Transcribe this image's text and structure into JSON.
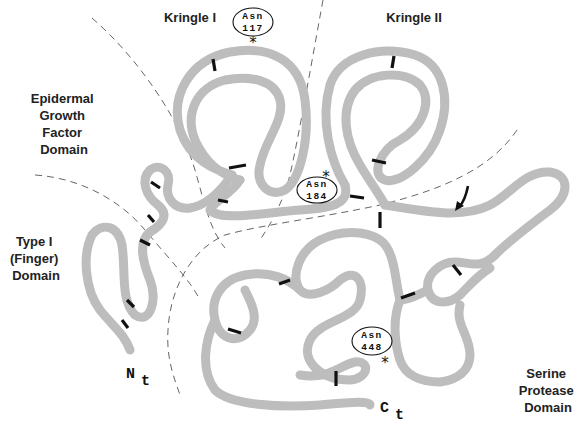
{
  "domains": [
    {
      "id": "kringle1",
      "lines": [
        "Kringle I"
      ]
    },
    {
      "id": "kringle2",
      "lines": [
        "Kringle II"
      ]
    },
    {
      "id": "egf",
      "lines": [
        "Epidermal",
        "Growth",
        "Factor",
        "Domain"
      ]
    },
    {
      "id": "finger",
      "lines": [
        "Type I",
        "(Finger)",
        "Domain"
      ]
    },
    {
      "id": "protease",
      "lines": [
        "Serine",
        "Protease",
        "Domain"
      ]
    }
  ],
  "glycosylation_sites": [
    {
      "residue": "Asn",
      "position": "117",
      "marker": "*"
    },
    {
      "residue": "Asn",
      "position": "184",
      "marker": "*"
    },
    {
      "residue": "Asn",
      "position": "448",
      "marker": "*"
    }
  ],
  "termini": {
    "n": {
      "letter": "N",
      "sub": "t"
    },
    "c": {
      "letter": "C",
      "sub": "t"
    }
  },
  "colors": {
    "chain": "#bdbdbd",
    "disulfide": "#111111",
    "boundary": "#555555",
    "text": "#222222"
  }
}
